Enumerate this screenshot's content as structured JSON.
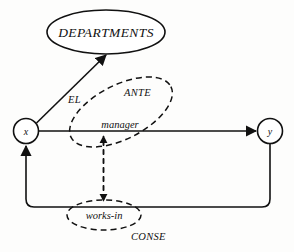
{
  "diagram": {
    "entities": [
      {
        "id": "departments",
        "label": "DEPARTMENTS",
        "shape": "ellipse",
        "cx": 106,
        "cy": 32
      },
      {
        "id": "x",
        "label": "x",
        "shape": "circle",
        "cx": 26,
        "cy": 131
      },
      {
        "id": "y",
        "label": "y",
        "shape": "circle",
        "cx": 270,
        "cy": 131
      }
    ],
    "relationships": [
      {
        "id": "manager",
        "label": "manager",
        "style": "dashed-ellipse",
        "cx": 121,
        "cy": 112
      },
      {
        "id": "works-in",
        "label": "works-in",
        "style": "dashed-ellipse",
        "cx": 104,
        "cy": 215
      }
    ],
    "annotations": [
      {
        "id": "el",
        "label": "EL",
        "x": 68,
        "y": 102
      },
      {
        "id": "ante",
        "label": "ANTE",
        "x": 124,
        "y": 95
      },
      {
        "id": "conse",
        "label": "CONSE",
        "x": 131,
        "y": 239
      }
    ],
    "edges": [
      {
        "id": "x-to-departments",
        "from": "x",
        "to": "departments",
        "style": "solid",
        "arrow": "end"
      },
      {
        "id": "x-to-y-manager",
        "from": "x",
        "to": "y",
        "style": "solid",
        "arrow": "end"
      },
      {
        "id": "y-to-x-works-in",
        "from": "y",
        "to": "x",
        "style": "solid",
        "arrow": "end"
      },
      {
        "id": "works-in-to-manager",
        "from": "works-in",
        "to": "manager",
        "style": "dashed",
        "arrow": "both"
      }
    ],
    "colors": {
      "stroke": "#111111",
      "background": "#fdfdfc",
      "fill": "#ffffff"
    }
  }
}
